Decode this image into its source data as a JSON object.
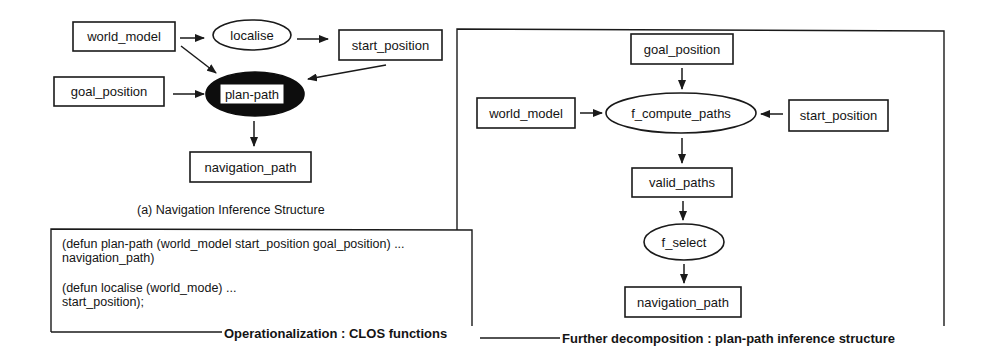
{
  "diagram_a": {
    "caption": "(a) Navigation Inference Structure",
    "nodes": {
      "world_model": "world_model",
      "localise": "localise",
      "start_position": "start_position",
      "goal_position": "goal_position",
      "plan_path": "plan-path",
      "navigation_path": "navigation_path"
    },
    "edges": [
      {
        "from": "world_model",
        "to": "localise"
      },
      {
        "from": "localise",
        "to": "start_position"
      },
      {
        "from": "world_model",
        "to": "plan-path"
      },
      {
        "from": "start_position",
        "to": "plan-path"
      },
      {
        "from": "goal_position",
        "to": "plan-path"
      },
      {
        "from": "plan-path",
        "to": "navigation_path"
      }
    ]
  },
  "code_box": {
    "lines": [
      "(defun plan-path (world_model start_position goal_position) ...",
      " navigation_path)",
      "(defun localise (world_mode) ...",
      " start_position);"
    ],
    "caption": "Operationalization : CLOS functions"
  },
  "diagram_b": {
    "caption": "Further decomposition : plan-path inference structure",
    "nodes": {
      "goal_position": "goal_position",
      "world_model": "world_model",
      "f_compute_paths": "f_compute_paths",
      "start_position": "start_position",
      "valid_paths": "valid_paths",
      "f_select": "f_select",
      "navigation_path": "navigation_path"
    },
    "edges": [
      {
        "from": "goal_position",
        "to": "f_compute_paths"
      },
      {
        "from": "world_model",
        "to": "f_compute_paths"
      },
      {
        "from": "start_position",
        "to": "f_compute_paths"
      },
      {
        "from": "f_compute_paths",
        "to": "valid_paths"
      },
      {
        "from": "valid_paths",
        "to": "f_select"
      },
      {
        "from": "f_select",
        "to": "navigation_path"
      }
    ]
  }
}
